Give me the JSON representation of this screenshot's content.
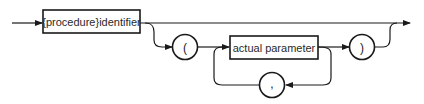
{
  "diagram": {
    "type": "syntax-diagram",
    "nodes": {
      "procedure_identifier": {
        "label": "{procedure}identifier",
        "shape": "rectangle"
      },
      "open_paren": {
        "label": "(",
        "shape": "circle"
      },
      "actual_parameter": {
        "label": "actual parameter",
        "shape": "rectangle"
      },
      "close_paren": {
        "label": ")",
        "shape": "circle"
      },
      "comma": {
        "label": ",",
        "shape": "circle"
      }
    },
    "edges": [
      {
        "from": "entry",
        "to": "procedure_identifier"
      },
      {
        "from": "procedure_identifier",
        "to": "exit",
        "path": "bypass"
      },
      {
        "from": "procedure_identifier",
        "to": "open_paren"
      },
      {
        "from": "open_paren",
        "to": "actual_parameter"
      },
      {
        "from": "actual_parameter",
        "to": "close_paren"
      },
      {
        "from": "actual_parameter",
        "to": "comma",
        "path": "loop-back"
      },
      {
        "from": "comma",
        "to": "actual_parameter"
      },
      {
        "from": "close_paren",
        "to": "exit"
      }
    ],
    "colors": {
      "line": "#1a1a1a",
      "background": "#ffffff"
    }
  }
}
